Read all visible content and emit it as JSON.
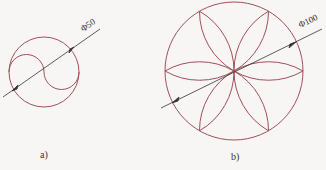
{
  "figures": [
    {
      "id": "a",
      "caption": "a)",
      "dimension": "Φ50",
      "description": "Circle with S-curve (yin-yang) formed by two semicircles"
    },
    {
      "id": "b",
      "caption": "b)",
      "dimension": "Φ100",
      "description": "Circle with six-petal rosette formed by arcs"
    }
  ],
  "colors": {
    "curve": "#a0505a",
    "leader": "#333333",
    "background": "#f7f6f4"
  }
}
